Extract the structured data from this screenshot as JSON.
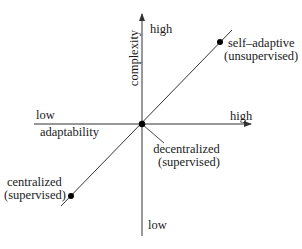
{
  "diagram": {
    "y_axis": {
      "label": "complexity",
      "high_label": "high",
      "low_label": "low"
    },
    "x_axis": {
      "label": "adaptability",
      "high_label": "high",
      "low_label": "low"
    },
    "points": [
      {
        "id": "self-adaptive",
        "line1": "self–adaptive",
        "line2": "(unsupervised)"
      },
      {
        "id": "decentralized",
        "line1": "decentralized",
        "line2": "(supervised)"
      },
      {
        "id": "centralized",
        "line1": "centralized",
        "line2": "(supervised)"
      }
    ],
    "colors": {
      "line": "#333333",
      "text": "#1a1a1a",
      "dot": "#000000",
      "background": "#ffffff"
    }
  }
}
